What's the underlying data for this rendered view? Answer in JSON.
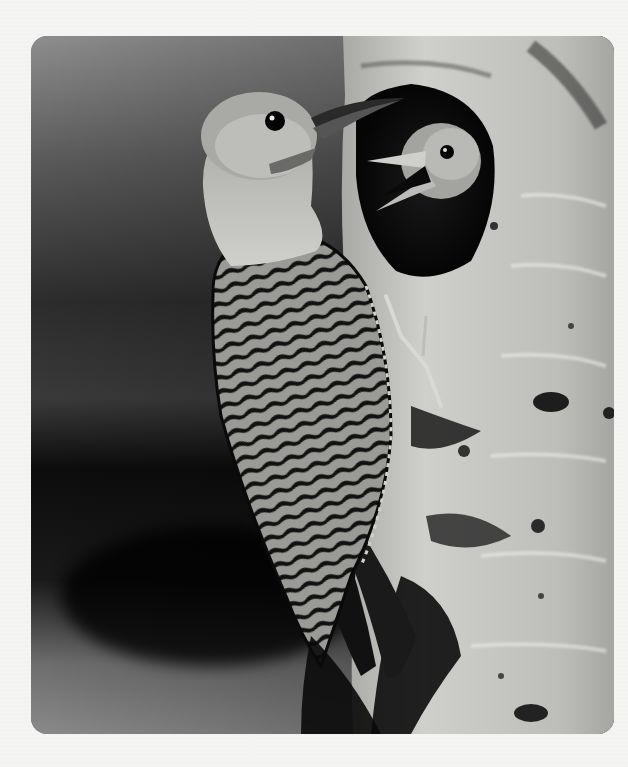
{
  "image": {
    "subject": "Northern flicker woodpecker feeding a nestling at a tree cavity",
    "style": "black-and-white photograph",
    "elements": [
      {
        "name": "adult-woodpecker",
        "description": "adult bird clinging to trunk, barred black-and-white back, long tail, head turned toward nest hole"
      },
      {
        "name": "nestling",
        "description": "chick peering from the cavity with beak open"
      },
      {
        "name": "tree-trunk",
        "description": "pale aspen-like bark with dark knots and lenticels"
      },
      {
        "name": "nest-cavity",
        "description": "dark oval hole in trunk"
      },
      {
        "name": "background",
        "description": "blurred gray-to-black bokeh"
      }
    ]
  },
  "colors": {
    "page_background": "#f4f4f2",
    "frame_bg_light": "#8a8a8a",
    "frame_bg_dark": "#111111",
    "bark": "#c9c9c6",
    "bark_dark": "#4a4a48",
    "bird_head": "#b5b5b2",
    "bird_dark": "#141414"
  }
}
